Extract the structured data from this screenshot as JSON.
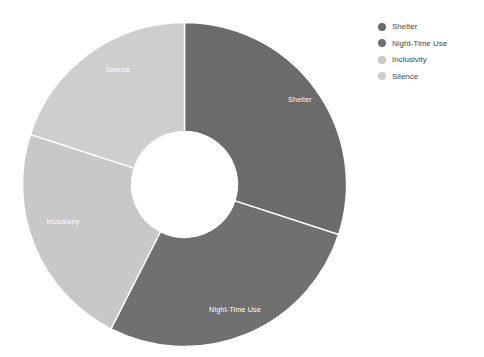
{
  "chart_data": {
    "type": "pie",
    "variant": "donut",
    "title": "",
    "subtitle": "",
    "xlabel": "",
    "ylabel": "",
    "grid": false,
    "legend_position": "top-right",
    "inner_radius_ratio": 0.327,
    "start_angle_deg": 0,
    "direction": "clockwise",
    "categories": [
      "Shelter",
      "Night-Time Use",
      "Inclusivity",
      "Silence"
    ],
    "values": [
      30,
      27.5,
      22.5,
      20
    ],
    "units": "percent",
    "colors": [
      "#6b6b6b",
      "#707070",
      "#c8c8c8",
      "#cecece"
    ],
    "slices": [
      {
        "label": "Shelter",
        "value": 30,
        "color": "#6b6b6b",
        "start_angle_deg": 0,
        "end_angle_deg": 108,
        "label_x": 300,
        "label_y": 100
      },
      {
        "label": "Night-Time Use",
        "value": 27.5,
        "color": "#707070",
        "start_angle_deg": 108,
        "end_angle_deg": 207,
        "label_x": 235,
        "label_y": 310
      },
      {
        "label": "Inclusivity",
        "value": 22.5,
        "color": "#c8c8c8",
        "start_angle_deg": 207,
        "end_angle_deg": 288,
        "label_x": 63,
        "label_y": 222
      },
      {
        "label": "Silence",
        "value": 20,
        "color": "#cecece",
        "start_angle_deg": 288,
        "end_angle_deg": 360,
        "label_x": 118,
        "label_y": 70
      }
    ]
  },
  "legend": {
    "items": [
      {
        "label": "Shelter",
        "color": "#6b6b6b"
      },
      {
        "label": "Night-Time Use",
        "color": "#707070"
      },
      {
        "label": "Inclusivity",
        "color": "#c8c8c8"
      },
      {
        "label": "Silence",
        "color": "#cecece"
      }
    ]
  },
  "canvas": {
    "background": "#ffffff",
    "separator_color": "#ffffff",
    "slice_label_color": "#ffffff",
    "legend_text_color": "#4a4a4a"
  }
}
